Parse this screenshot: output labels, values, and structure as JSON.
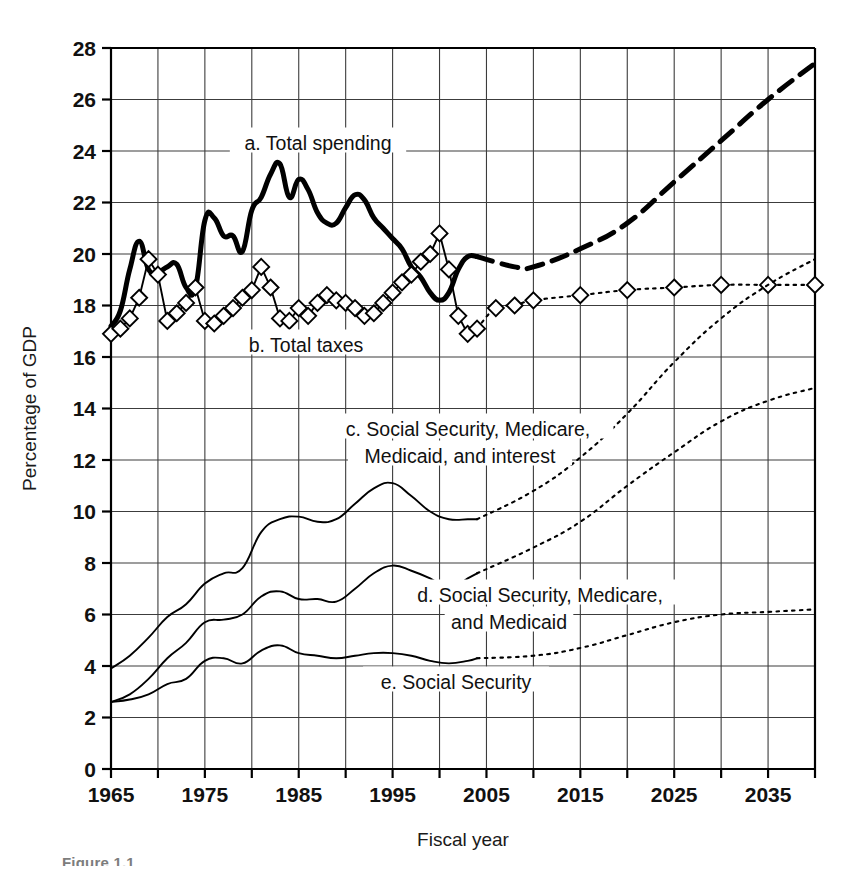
{
  "figure": {
    "caption": "Figure 1.1",
    "background_color": "#ffffff",
    "ink_color": "#000000"
  },
  "chart_data": {
    "type": "line",
    "title": "",
    "xlabel": "Fiscal year",
    "ylabel": "Percentage of GDP",
    "xlim": [
      1965,
      2040
    ],
    "ylim": [
      0,
      28
    ],
    "ytick_step": 2,
    "yticks": [
      0,
      2,
      4,
      6,
      8,
      10,
      12,
      14,
      16,
      18,
      20,
      22,
      24,
      26,
      28
    ],
    "xticks": [
      1965,
      1970,
      1975,
      1980,
      1985,
      1990,
      1995,
      2000,
      2005,
      2010,
      2015,
      2020,
      2025,
      2030,
      2035,
      2040
    ],
    "xticklabels": [
      "1965",
      "",
      "1975",
      "",
      "1985",
      "",
      "1995",
      "",
      "2005",
      "",
      "2015",
      "",
      "2025",
      "",
      "2035",
      ""
    ],
    "grid": true,
    "legend_position": "inline-annotations",
    "projection_start_year": 2004,
    "series": [
      {
        "name": "a. Total spending",
        "key": "total_spending",
        "style": "thick-solid",
        "projection_style": "thick-dashed",
        "marker": "none",
        "label": "a. Total spending",
        "x": [
          1965,
          1966,
          1967,
          1968,
          1969,
          1970,
          1971,
          1972,
          1973,
          1974,
          1975,
          1976,
          1977,
          1978,
          1979,
          1980,
          1981,
          1982,
          1983,
          1984,
          1985,
          1986,
          1987,
          1988,
          1989,
          1990,
          1991,
          1992,
          1993,
          1994,
          1995,
          1996,
          1997,
          1998,
          1999,
          2000,
          2001,
          2002,
          2003,
          2004
        ],
        "values": [
          17.2,
          17.8,
          19.4,
          20.5,
          19.4,
          19.3,
          19.5,
          19.6,
          18.7,
          18.7,
          21.3,
          21.4,
          20.7,
          20.7,
          20.1,
          21.7,
          22.2,
          23.1,
          23.5,
          22.2,
          22.9,
          22.5,
          21.6,
          21.2,
          21.2,
          21.8,
          22.3,
          22.1,
          21.4,
          21.0,
          20.6,
          20.2,
          19.5,
          19.1,
          18.5,
          18.2,
          18.5,
          19.4,
          19.9,
          19.9
        ],
        "projected_x": [
          2004,
          2008,
          2010,
          2015,
          2020,
          2025,
          2030,
          2035,
          2040
        ],
        "projected_values": [
          19.9,
          19.5,
          19.5,
          20.2,
          21.2,
          22.8,
          24.4,
          26.0,
          27.4
        ]
      },
      {
        "name": "b. Total taxes",
        "key": "total_taxes",
        "style": "thin-solid",
        "projection_style": "dotted",
        "marker": "diamond",
        "label": "b. Total taxes",
        "x": [
          1965,
          1966,
          1967,
          1968,
          1969,
          1970,
          1971,
          1972,
          1973,
          1974,
          1975,
          1976,
          1977,
          1978,
          1979,
          1980,
          1981,
          1982,
          1983,
          1984,
          1985,
          1986,
          1987,
          1988,
          1989,
          1990,
          1991,
          1992,
          1993,
          1994,
          1995,
          1996,
          1997,
          1998,
          1999,
          2000,
          2001,
          2002,
          2003,
          2004
        ],
        "values": [
          16.9,
          17.1,
          17.5,
          18.3,
          19.8,
          19.2,
          17.4,
          17.7,
          18.1,
          18.7,
          17.4,
          17.3,
          17.6,
          17.9,
          18.3,
          18.6,
          19.5,
          18.7,
          17.5,
          17.4,
          17.9,
          17.6,
          18.1,
          18.4,
          18.2,
          18.1,
          17.9,
          17.6,
          17.7,
          18.1,
          18.5,
          18.9,
          19.2,
          19.7,
          20.0,
          20.8,
          19.4,
          17.6,
          16.9,
          17.1
        ],
        "projected_x": [
          2004,
          2006,
          2008,
          2010,
          2015,
          2020,
          2025,
          2030,
          2035,
          2040
        ],
        "projected_values": [
          17.1,
          17.9,
          18.0,
          18.2,
          18.4,
          18.6,
          18.7,
          18.8,
          18.8,
          18.8
        ]
      },
      {
        "name": "c. Social Security, Medicare, Medicaid, and interest",
        "key": "ss_medicare_medicaid_interest",
        "style": "thin-solid",
        "projection_style": "dotted",
        "marker": "none",
        "label_line1": "c. Social Security, Medicare,",
        "label_line2": "Medicaid, and interest",
        "x": [
          1965,
          1967,
          1969,
          1971,
          1973,
          1975,
          1977,
          1979,
          1981,
          1983,
          1985,
          1987,
          1989,
          1991,
          1993,
          1995,
          1997,
          1999,
          2001,
          2003,
          2004
        ],
        "values": [
          3.9,
          4.4,
          5.1,
          5.9,
          6.4,
          7.2,
          7.6,
          7.8,
          9.2,
          9.7,
          9.8,
          9.6,
          9.7,
          10.3,
          10.9,
          11.1,
          10.6,
          10.0,
          9.7,
          9.7,
          9.7
        ],
        "projected_x": [
          2004,
          2010,
          2015,
          2020,
          2025,
          2030,
          2035,
          2040
        ],
        "projected_values": [
          9.7,
          10.8,
          12.1,
          13.8,
          15.8,
          17.5,
          18.8,
          19.8
        ]
      },
      {
        "name": "d. Social Security, Medicare, and Medicaid",
        "key": "ss_medicare_medicaid",
        "style": "thin-solid",
        "projection_style": "dotted",
        "marker": "none",
        "label_line1": "d. Social Security, Medicare,",
        "label_line2": "and Medicaid",
        "x": [
          1965,
          1967,
          1969,
          1971,
          1973,
          1975,
          1977,
          1979,
          1981,
          1983,
          1985,
          1987,
          1989,
          1991,
          1993,
          1995,
          1997,
          1999,
          2001,
          2003,
          2004
        ],
        "values": [
          2.6,
          2.9,
          3.5,
          4.3,
          4.9,
          5.7,
          5.8,
          6.0,
          6.7,
          6.9,
          6.6,
          6.6,
          6.5,
          7.0,
          7.6,
          7.9,
          7.7,
          7.4,
          7.0,
          7.4,
          7.6
        ],
        "projected_x": [
          2004,
          2010,
          2015,
          2020,
          2025,
          2030,
          2035,
          2040
        ],
        "projected_values": [
          7.6,
          8.6,
          9.6,
          11.0,
          12.3,
          13.5,
          14.3,
          14.8
        ]
      },
      {
        "name": "e. Social Security",
        "key": "social_security",
        "style": "thin-solid",
        "projection_style": "dotted",
        "marker": "none",
        "label": "e. Social Security",
        "x": [
          1965,
          1967,
          1969,
          1971,
          1973,
          1975,
          1977,
          1979,
          1981,
          1983,
          1985,
          1987,
          1989,
          1991,
          1993,
          1995,
          1997,
          1999,
          2001,
          2003,
          2004
        ],
        "values": [
          2.6,
          2.7,
          2.9,
          3.3,
          3.5,
          4.2,
          4.3,
          4.1,
          4.6,
          4.8,
          4.5,
          4.4,
          4.3,
          4.4,
          4.5,
          4.5,
          4.4,
          4.2,
          4.1,
          4.2,
          4.3
        ],
        "projected_x": [
          2004,
          2010,
          2015,
          2020,
          2025,
          2030,
          2035,
          2040
        ],
        "projected_values": [
          4.3,
          4.4,
          4.7,
          5.2,
          5.7,
          6.0,
          6.1,
          6.2
        ]
      }
    ]
  }
}
